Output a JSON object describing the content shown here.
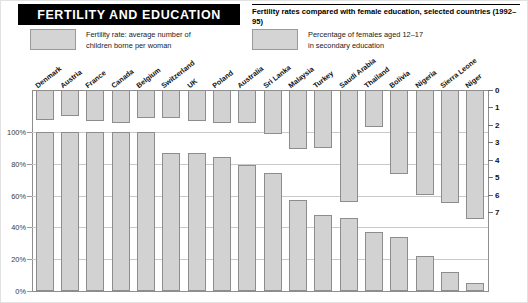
{
  "header": {
    "title": "FERTILITY AND EDUCATION",
    "subtitle": "Fertility rates compared with female education, selected countries (1992–95)"
  },
  "legend": {
    "items": [
      {
        "label": "Fertility rate: average number of\nchildren borne per woman",
        "color": "#d4d4d4",
        "name": "fertility"
      },
      {
        "label": "Percentage of females aged 12–17\nin secondary education",
        "color": "#d4d4d4",
        "name": "education"
      }
    ]
  },
  "axes": {
    "left_ticks": [
      "100%",
      "80%",
      "60%",
      "40%",
      "20%",
      "0%"
    ],
    "left_values": [
      100,
      80,
      60,
      40,
      20,
      0
    ],
    "right_ticks": [
      "0",
      "1",
      "2",
      "3",
      "4",
      "5",
      "6",
      "7"
    ],
    "right_values": [
      0,
      1,
      2,
      3,
      4,
      5,
      6,
      7
    ]
  },
  "chart_data": {
    "type": "bar",
    "title": "FERTILITY AND EDUCATION",
    "subtitle": "Fertility rates compared with female education, selected countries (1992–95)",
    "xlabel": "",
    "ylabel": "Percentage of females aged 12–17 in secondary education",
    "ylabel_secondary": "Fertility rate: average number of children borne per woman",
    "ylim": [
      0,
      100
    ],
    "ylim_secondary": [
      0,
      7
    ],
    "secondary_axis_inverted": true,
    "grid": true,
    "legend_position": "top",
    "categories": [
      "Denmark",
      "Austria",
      "France",
      "Canada",
      "Belgium",
      "Switzerland",
      "UK",
      "Poland",
      "Australia",
      "Sri Lanka",
      "Malaysia",
      "Turkey",
      "Saudi Arabia",
      "Thailand",
      "Bolivia",
      "Nigeria",
      "Sierra Leone",
      "Niger"
    ],
    "series": [
      {
        "name": "Fertility rate: average number of children borne per woman",
        "axis": "right",
        "units": "children per woman",
        "values": [
          1.7,
          1.5,
          1.8,
          1.9,
          1.6,
          1.6,
          1.8,
          1.9,
          1.9,
          2.5,
          3.4,
          3.3,
          6.4,
          2.1,
          4.8,
          6.0,
          6.5,
          7.4
        ]
      },
      {
        "name": "Percentage of females aged 12–17 in secondary education",
        "axis": "left",
        "units": "%",
        "values": [
          100,
          100,
          100,
          100,
          100,
          87,
          87,
          84,
          79,
          74,
          57,
          48,
          46,
          37,
          34,
          22,
          12,
          5
        ]
      }
    ]
  }
}
